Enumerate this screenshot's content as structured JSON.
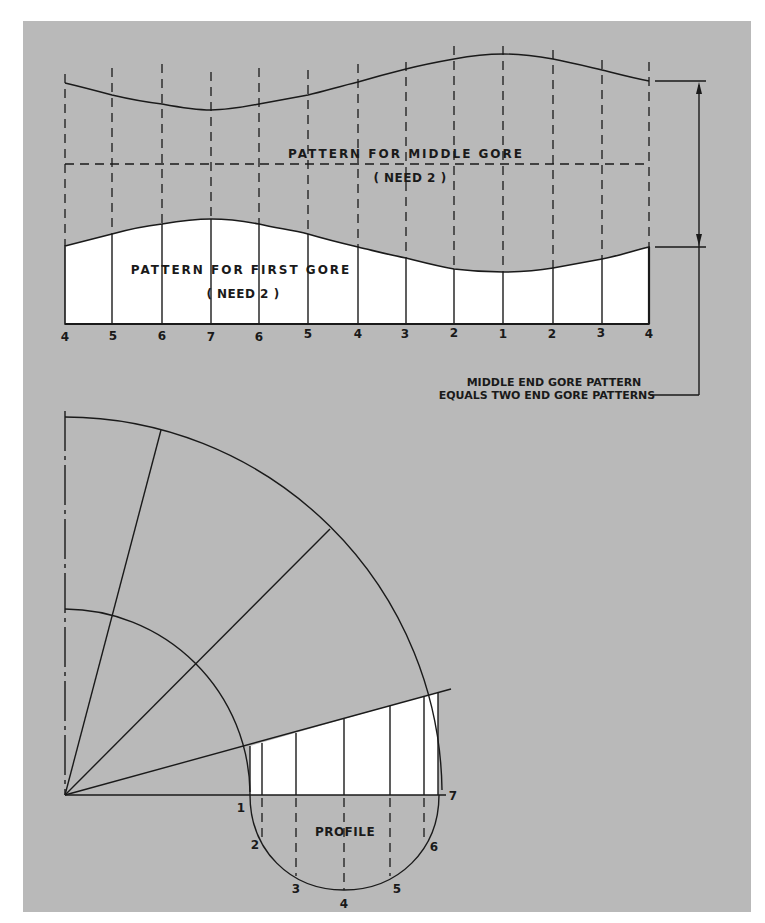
{
  "figure": {
    "background_color": "#b9b9b9",
    "ink_color": "#1a1a1a",
    "pattern_fill": "#ffffff"
  },
  "gore_patterns": {
    "middle_gore": {
      "title": "PATTERN FOR MIDDLE GORE",
      "quantity": "( NEED 2 )"
    },
    "first_gore": {
      "title": "PATTERN FOR FIRST GORE",
      "quantity": "( NEED 2 )"
    },
    "station_labels": [
      "4",
      "5",
      "6",
      "7",
      "6",
      "5",
      "4",
      "3",
      "2",
      "1",
      "2",
      "3",
      "4"
    ],
    "dimension_note": {
      "line1": "MIDDLE END GORE PATTERN",
      "line2": "EQUALS TWO END GORE PATTERNS"
    }
  },
  "development": {
    "profile_label": "PROFILE",
    "profile_points": [
      "1",
      "2",
      "3",
      "4",
      "5",
      "6",
      "7"
    ]
  }
}
